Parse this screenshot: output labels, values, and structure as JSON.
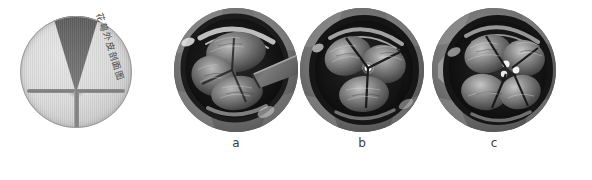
{
  "figure": {
    "background_color": "#ffffff",
    "width": 592,
    "height": 180
  },
  "schematic": {
    "name": "cross-section-schematic",
    "caption": "花萼外皮剖面图",
    "disc_fill": "#dedede",
    "wedge_fill": "#6a6a6a",
    "bar_fill": "#7c7c7c",
    "description": "圆形截面示意图，上部为深色倒三角楔形，下部为T形横杆与竖杆"
  },
  "panels": [
    {
      "id": "a",
      "label": "a",
      "name": "endoscopic-photo-a",
      "alt": "瓣膜内镜图像 a"
    },
    {
      "id": "b",
      "label": "b",
      "name": "endoscopic-photo-b",
      "alt": "瓣膜内镜图像 b"
    },
    {
      "id": "c",
      "label": "c",
      "name": "endoscopic-photo-c",
      "alt": "瓣膜内镜图像 c"
    }
  ]
}
